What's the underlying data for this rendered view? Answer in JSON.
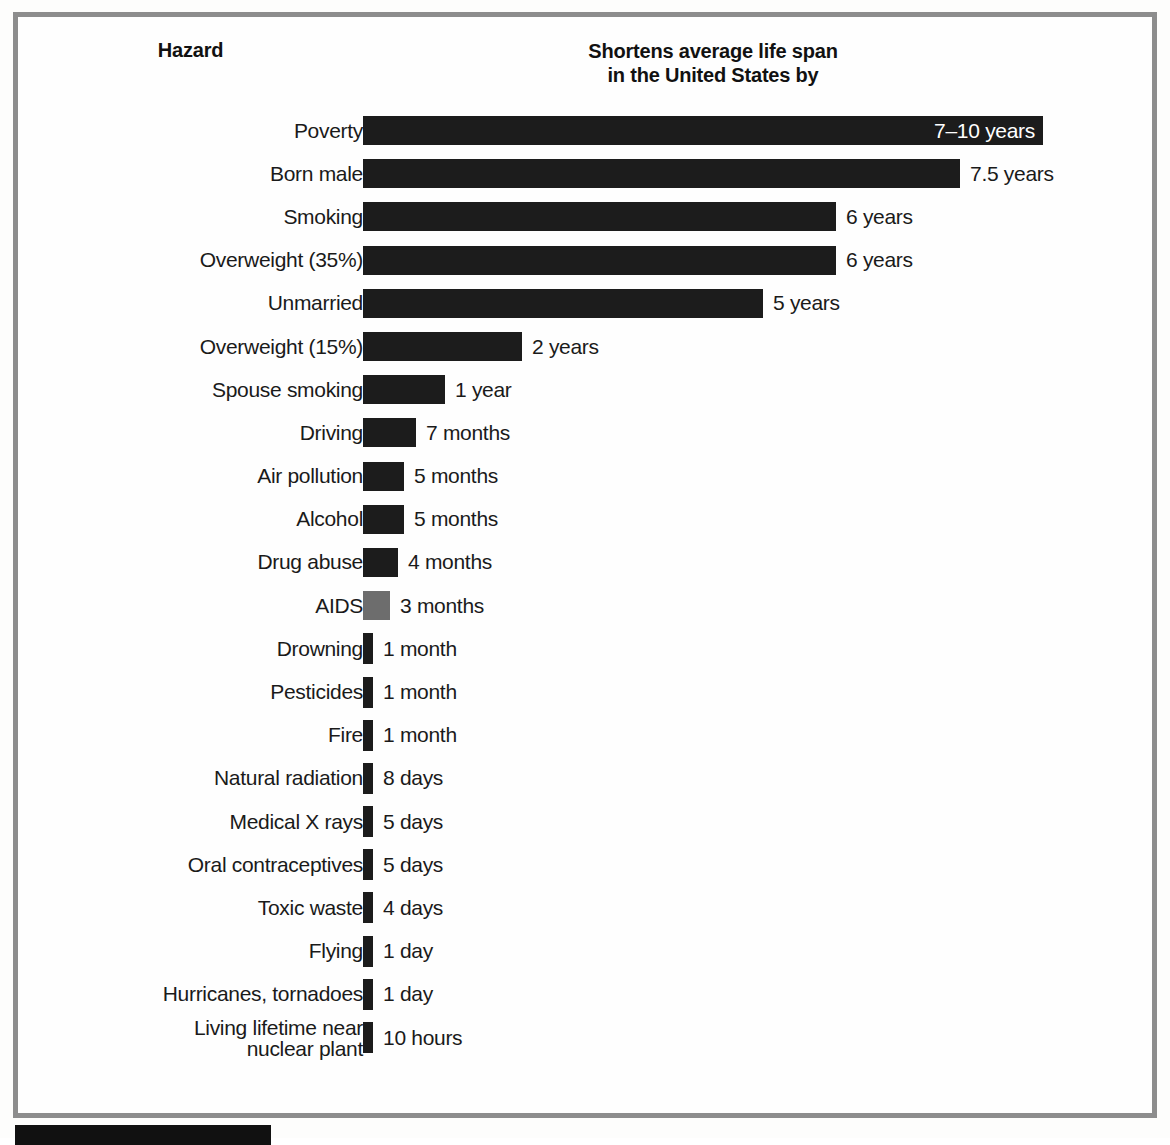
{
  "figure": {
    "hazard_column_header": "Hazard",
    "value_column_header_line1": "Shortens average life span",
    "value_column_header_line2": "in the United States by",
    "frame_color": "#8d8d8d",
    "bar_color": "#1c1c1c",
    "bar_color_alt": "#6d6d6d",
    "background_color": "#fefefe"
  },
  "chart_data": {
    "type": "bar",
    "orientation": "horizontal",
    "title": "Shortens average life span in the United States by",
    "xlabel": "",
    "ylabel": "Hazard",
    "grid": false,
    "legend": "none",
    "categories": [
      "Poverty",
      "Born male",
      "Smoking",
      "Overweight (35%)",
      "Unmarried",
      "Overweight (15%)",
      "Spouse smoking",
      "Driving",
      "Air pollution",
      "Alcohol",
      "Drug abuse",
      "AIDS",
      "Drowning",
      "Pesticides",
      "Fire",
      "Natural radiation",
      "Medical X rays",
      "Oral contraceptives",
      "Toxic waste",
      "Flying",
      "Hurricanes, tornadoes",
      "Living lifetime near nuclear plant"
    ],
    "value_labels": [
      "7–10 years",
      "7.5 years",
      "6 years",
      "6 years",
      "5 years",
      "2 years",
      "1 year",
      "7 months",
      "5 months",
      "5 months",
      "4 months",
      "3 months",
      "1 month",
      "1 month",
      "1 month",
      "8 days",
      "5 days",
      "5 days",
      "4 days",
      "1 day",
      "1 day",
      "10 hours"
    ],
    "values_years": [
      8.5,
      7.5,
      6,
      6,
      5,
      2,
      1,
      0.583,
      0.417,
      0.417,
      0.333,
      0.25,
      0.0833,
      0.0833,
      0.0833,
      0.0219,
      0.0137,
      0.0137,
      0.011,
      0.0027,
      0.0027,
      0.00114
    ],
    "bar_pixel_widths": [
      680,
      597,
      473,
      473,
      400,
      159,
      82,
      53,
      41,
      41,
      35,
      27,
      10,
      10,
      10,
      10,
      10,
      10,
      10,
      10,
      10,
      10
    ],
    "bar_shades": [
      "dark",
      "dark",
      "dark",
      "dark",
      "dark",
      "dark",
      "dark",
      "dark",
      "dark",
      "dark",
      "dark",
      "gray",
      "dark",
      "dark",
      "dark",
      "dark",
      "dark",
      "dark",
      "dark",
      "dark",
      "dark",
      "dark"
    ],
    "label_placement": [
      "inside",
      "outside",
      "outside",
      "outside",
      "outside",
      "outside",
      "outside",
      "outside",
      "outside",
      "outside",
      "outside",
      "outside",
      "outside",
      "outside",
      "outside",
      "outside",
      "outside",
      "outside",
      "outside",
      "outside",
      "outside",
      "outside"
    ]
  }
}
